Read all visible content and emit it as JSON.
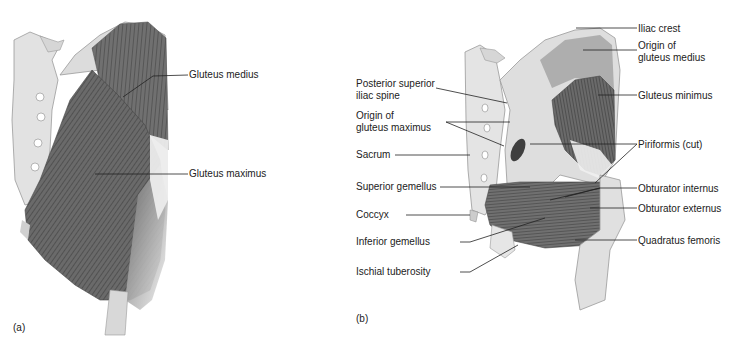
{
  "panels": [
    {
      "id": "a",
      "tag": "(a)",
      "labels": [
        {
          "text": "Gluteus medius"
        },
        {
          "text": "Gluteus maximus"
        }
      ]
    },
    {
      "id": "b",
      "tag": "(b)",
      "labels_left": [
        {
          "text": "Posterior superior\niliac spine"
        },
        {
          "text": "Origin of\ngluteus maximus"
        },
        {
          "text": "Sacrum"
        },
        {
          "text": "Superior gemellus"
        },
        {
          "text": "Coccyx"
        },
        {
          "text": "Inferior gemellus"
        },
        {
          "text": "Ischial tuberosity"
        }
      ],
      "labels_right": [
        {
          "text": "Iliac crest"
        },
        {
          "text": "Origin of\ngluteus medius"
        },
        {
          "text": "Gluteus minimus"
        },
        {
          "text": "Piriformis (cut)"
        },
        {
          "text": "Obturator internus"
        },
        {
          "text": "Obturator externus"
        },
        {
          "text": "Quadratus femoris"
        }
      ]
    }
  ],
  "colors": {
    "bone": "#e6e6e6",
    "bone_shade": "#bdbdbd",
    "muscle_dark": "#5a5a5a",
    "muscle_mid": "#7d7d7d",
    "leader": "#222222"
  }
}
